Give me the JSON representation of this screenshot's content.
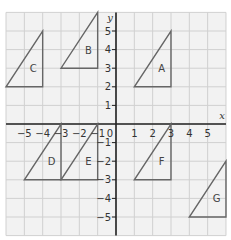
{
  "diagram": {
    "axes": {
      "x_label": "x",
      "y_label": "y",
      "origin_label": "0",
      "x_range": [
        -6,
        6
      ],
      "y_range": [
        -6,
        6
      ],
      "x_ticks": [
        "−5",
        "−4",
        "−3",
        "−2",
        "−1",
        "1",
        "2",
        "3",
        "4",
        "5"
      ],
      "y_ticks": [
        "5",
        "4",
        "3",
        "2",
        "1",
        "−1",
        "−2",
        "−3",
        "−4",
        "−5"
      ]
    },
    "colors": {
      "grid": "#d0d0d0",
      "grid_background": "#f2f2f2",
      "axis": "#222222",
      "shape": "#666666"
    },
    "triangles": [
      {
        "label": "A",
        "vertices": [
          [
            1,
            2
          ],
          [
            3,
            2
          ],
          [
            3,
            5
          ]
        ]
      },
      {
        "label": "B",
        "vertices": [
          [
            -3,
            3
          ],
          [
            -1,
            3
          ],
          [
            -1,
            6
          ]
        ]
      },
      {
        "label": "C",
        "vertices": [
          [
            -6,
            2
          ],
          [
            -4,
            2
          ],
          [
            -4,
            5
          ]
        ]
      },
      {
        "label": "D",
        "vertices": [
          [
            -5,
            -3
          ],
          [
            -3,
            -3
          ],
          [
            -3,
            0
          ]
        ]
      },
      {
        "label": "E",
        "vertices": [
          [
            -3,
            -3
          ],
          [
            -1,
            -3
          ],
          [
            -1,
            0
          ]
        ]
      },
      {
        "label": "F",
        "vertices": [
          [
            1,
            -3
          ],
          [
            3,
            -3
          ],
          [
            3,
            0
          ]
        ]
      },
      {
        "label": "G",
        "vertices": [
          [
            4,
            -5
          ],
          [
            6,
            -5
          ],
          [
            6,
            -2
          ]
        ]
      }
    ]
  }
}
